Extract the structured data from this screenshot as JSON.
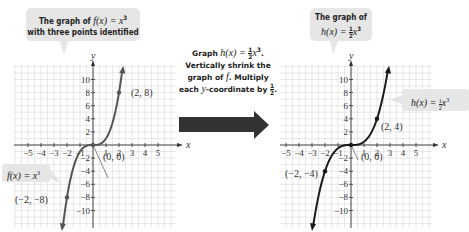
{
  "left_callout": {
    "line1_prefix": "The graph of ",
    "func": "f(x) = x",
    "exp": "3",
    "line2": "with three points identified"
  },
  "left_label": {
    "text": "f(x) = x",
    "exp": "3"
  },
  "middle": {
    "line1_prefix": "Graph ",
    "line1_func": "h(x) = ",
    "line1_frac_num": "1",
    "line1_frac_den": "2",
    "line1_x": "x",
    "line1_exp": "3",
    "line2": "Vertically shrink the",
    "line3_prefix": "graph of ",
    "line3_f": "f",
    "line3_suffix": ". Multiply",
    "line4_prefix": "each ",
    "line4_y": "y",
    "line4_suffix": "-coordinate by ",
    "line4_frac_num": "1",
    "line4_frac_den": "2"
  },
  "right_callout": {
    "line1": "The graph of",
    "func": "h(x) = ",
    "frac_num": "1",
    "frac_den": "2",
    "x": "x",
    "exp": "3"
  },
  "right_label": {
    "func": "h(x) = ",
    "frac_num": "1",
    "frac_den": "2",
    "x": "x",
    "exp": "3"
  },
  "colors": {
    "grid": "#d9d9d9",
    "axis": "#333333",
    "left_curve": "#555555",
    "right_curve": "#1a1a1a",
    "arrow": "#333333",
    "callout_bg": "#e6e6e6"
  },
  "chart_data": [
    {
      "type": "line",
      "title": "The graph of f(x) = x^3 with three points identified",
      "xlabel": "x",
      "ylabel": "y",
      "xlim": [
        -6,
        6
      ],
      "ylim": [
        -12,
        12
      ],
      "x_ticks": [
        -5,
        -4,
        -3,
        -2,
        -1,
        1,
        2,
        3,
        4,
        5
      ],
      "y_ticks": [
        -10,
        -8,
        -6,
        -4,
        -2,
        2,
        4,
        6,
        8,
        10
      ],
      "grid": true,
      "series": [
        {
          "name": "f(x) = x^3",
          "function": "x^3"
        }
      ],
      "points": [
        {
          "label": "(2, 8)",
          "x": 2,
          "y": 8
        },
        {
          "label": "(0, 0)",
          "x": 0,
          "y": 0
        },
        {
          "label": "(-2, -8)",
          "x": -2,
          "y": -8
        }
      ]
    },
    {
      "type": "line",
      "title": "The graph of h(x) = 1/2 x^3",
      "xlabel": "x",
      "ylabel": "y",
      "xlim": [
        -6,
        6
      ],
      "ylim": [
        -12,
        12
      ],
      "x_ticks": [
        -5,
        -4,
        -3,
        -2,
        -1,
        1,
        2,
        3,
        4,
        5
      ],
      "y_ticks": [
        -10,
        -8,
        -6,
        -4,
        -2,
        2,
        4,
        6,
        8,
        10
      ],
      "grid": true,
      "series": [
        {
          "name": "h(x) = 1/2 x^3",
          "function": "0.5*x^3"
        }
      ],
      "points": [
        {
          "label": "(2, 4)",
          "x": 2,
          "y": 4
        },
        {
          "label": "(0, 0)",
          "x": 0,
          "y": 0
        },
        {
          "label": "(-2, -4)",
          "x": -2,
          "y": -4
        }
      ]
    }
  ]
}
